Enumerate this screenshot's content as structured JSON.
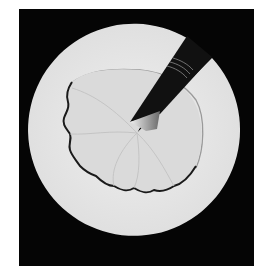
{
  "image": {
    "description": "Black-and-white photograph of a white circular disc on a black background, with a wedge-shaped cut at the upper right holding a dark blade/strip pointing to the disc center, and an irregular scalloped stain spreading from the center with a dark jagged border.",
    "colors": {
      "page_background": "#ffffff",
      "frame": "#050505",
      "disc": "#e8e8e8",
      "stain_fill": "#dcdcdc",
      "stain_edge": "#1a1a1a",
      "blade": "#111111"
    }
  }
}
